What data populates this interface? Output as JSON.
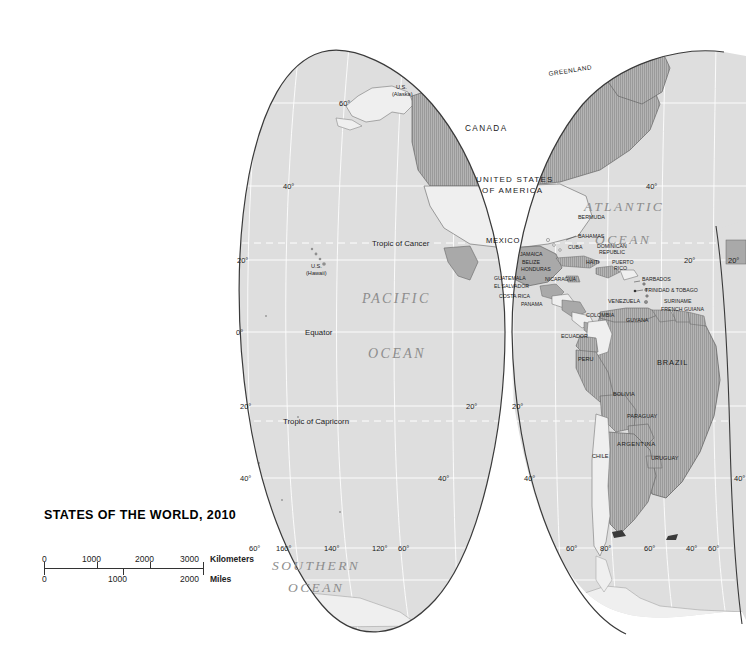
{
  "legend": {
    "title": "STATES OF THE WORLD, 2010",
    "scale": {
      "km": {
        "unit": "Kilometers",
        "ticks": [
          "0",
          "1000",
          "2000",
          "3000"
        ]
      },
      "mi": {
        "unit": "Miles",
        "ticks": [
          "0",
          "1000",
          "2000"
        ]
      }
    }
  },
  "map": {
    "projection": "interrupted-goode-homolosine",
    "colors": {
      "page_background": "#ffffff",
      "ocean_fill": "#dedede",
      "land_plain_fill": "#efefef",
      "land_hatched_fill": "#a9a9a9",
      "graticule": "#ffffff",
      "tropic_line": "#ffffff",
      "outline": "#3a3a3a",
      "label_text": "#1a1a1a",
      "ocean_label_text": "#8d8d8d"
    },
    "oceans": [
      {
        "name": "PACIFIC",
        "line2": "OCEAN"
      },
      {
        "name": "ATLANTIC",
        "line2": "OCEAN"
      },
      {
        "name": "SOUTHERN",
        "line2": "OCEAN"
      }
    ],
    "reference_lines": [
      {
        "label": "Tropic of Cancer"
      },
      {
        "label": "Equator"
      },
      {
        "label": "Tropic of Capricorn"
      }
    ],
    "latitude_labels": [
      "60°",
      "40°",
      "20°",
      "0°",
      "20°",
      "40°",
      "60°"
    ],
    "longitude_labels": [
      "160°",
      "140°",
      "120°",
      "80°",
      "60°",
      "40°",
      "20°"
    ],
    "countries": [
      {
        "id": "greenland",
        "label": "GREENLAND",
        "fill": "hatched"
      },
      {
        "id": "canada",
        "label": "CANADA",
        "fill": "hatched"
      },
      {
        "id": "usa",
        "label": "UNITED STATES",
        "label2": "OF AMERICA",
        "fill": "plain"
      },
      {
        "id": "alaska",
        "label": "U.S.",
        "label2": "(Alaska)",
        "fill": "plain"
      },
      {
        "id": "hawaii",
        "label": "U.S.",
        "label2": "(Hawaii)",
        "fill": "plain"
      },
      {
        "id": "mexico",
        "label": "MEXICO",
        "fill": "hatched"
      },
      {
        "id": "bermuda",
        "label": "BERMUDA",
        "fill": "plain"
      },
      {
        "id": "bahamas",
        "label": "BAHAMAS",
        "fill": "plain"
      },
      {
        "id": "cuba",
        "label": "CUBA",
        "fill": "hatched"
      },
      {
        "id": "jamaica",
        "label": "JAMAICA",
        "fill": "hatched"
      },
      {
        "id": "haiti",
        "label": "HAITI",
        "fill": "hatched"
      },
      {
        "id": "dominican",
        "label": "DOMINICAN",
        "label2": "REPUBLIC",
        "fill": "plain"
      },
      {
        "id": "puertorico",
        "label": "PUERTO",
        "label2": "RICO",
        "fill": "plain"
      },
      {
        "id": "belize",
        "label": "BELIZE",
        "fill": "plain"
      },
      {
        "id": "guatemala",
        "label": "GUATEMALA",
        "fill": "hatched"
      },
      {
        "id": "honduras",
        "label": "HONDURAS",
        "fill": "plain"
      },
      {
        "id": "elsalvador",
        "label": "EL SALVADOR",
        "fill": "hatched"
      },
      {
        "id": "nicaragua",
        "label": "NICARAGUA",
        "fill": "hatched"
      },
      {
        "id": "costarica",
        "label": "COSTA RICA",
        "fill": "plain"
      },
      {
        "id": "panama",
        "label": "PANAMA",
        "fill": "hatched"
      },
      {
        "id": "barbados",
        "label": "BARBADOS",
        "fill": "plain"
      },
      {
        "id": "trinidad",
        "label": "TRINIDAD & TOBAGO",
        "fill": "hatched"
      },
      {
        "id": "venezuela",
        "label": "VENEZUELA",
        "fill": "hatched"
      },
      {
        "id": "colombia",
        "label": "COLOMBIA",
        "fill": "plain"
      },
      {
        "id": "guyana",
        "label": "GUYANA",
        "fill": "hatched"
      },
      {
        "id": "suriname",
        "label": "SURINAME",
        "fill": "hatched"
      },
      {
        "id": "frenchguiana",
        "label": "FRENCH GUIANA",
        "fill": "hatched"
      },
      {
        "id": "ecuador",
        "label": "ECUADOR",
        "fill": "hatched"
      },
      {
        "id": "peru",
        "label": "PERU",
        "fill": "hatched"
      },
      {
        "id": "brazil",
        "label": "BRAZIL",
        "fill": "hatched"
      },
      {
        "id": "bolivia",
        "label": "BOLIVIA",
        "fill": "hatched"
      },
      {
        "id": "paraguay",
        "label": "PARAGUAY",
        "fill": "hatched"
      },
      {
        "id": "chile",
        "label": "CHILE",
        "fill": "plain"
      },
      {
        "id": "argentina",
        "label": "ARGENTINA",
        "fill": "hatched"
      },
      {
        "id": "uruguay",
        "label": "URUGUAY",
        "fill": "hatched"
      }
    ]
  }
}
